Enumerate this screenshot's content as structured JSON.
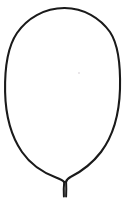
{
  "image": {
    "title": "Leaf Outline Drawing",
    "caption": "Hand-drawn black outline of an ovate leaf blade with a short petiole stem at the bottom",
    "width": 128,
    "height": 202,
    "background_color": "#ffffff",
    "stroke_color": "#1a1a1a"
  },
  "figure": {
    "blade": {
      "name": "leaf-blade-outline",
      "stroke_color": "#1a1a1a",
      "stroke_width": 2.1,
      "fill": "none",
      "apex_point": [
        64,
        8
      ],
      "leftmost_point": [
        5,
        99
      ],
      "rightmost_point": [
        120,
        97
      ],
      "base_point": [
        64,
        180
      ],
      "path": "M 64.5 8 C 44 8 27 18.5 17 33 C 7.5 47 4.6 68 5.1 92 C 5.6 115 11 136 22 152 C 31 165 44 173 56 177.5 C 61 179.4 63 180.5 64.2 182"
    },
    "blade_right": {
      "name": "leaf-blade-outline-right",
      "stroke_color": "#1a1a1a",
      "stroke_width": 2.1,
      "fill": "none",
      "path": "M 64.5 8 C 84 8.2 100 18 110 32 C 119 45.5 120.6 66 120 89 C 119.3 113 113 136 101 152 C 91 165 78.5 173 70.5 177 C 67.6 178.6 66.4 180 66 182"
    },
    "stem": {
      "name": "leaf-petiole-stem",
      "stroke_color": "#1a1a1a",
      "stroke_width": 2.0,
      "fill": "none",
      "top_point": [
        64,
        181
      ],
      "bottom_point": [
        65,
        197
      ],
      "path_left": "M 64.2 182 C 63.6 187 63.7 192 63.9 196.5",
      "path_right": "M 66.1 182 C 66.4 187 66.3 192 66.1 196.5"
    },
    "artifact_speck": {
      "name": "faint-gray-speck",
      "color": "#ddd9dd",
      "x": 78,
      "y": 72
    }
  }
}
